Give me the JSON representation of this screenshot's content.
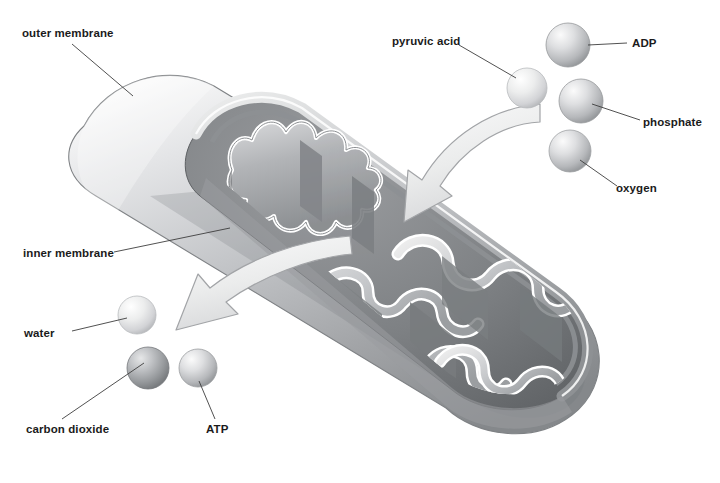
{
  "figure": {
    "background_color": "#ffffff",
    "label_color": "#1b1b1b",
    "leader_line_color": "#3d3d3d"
  },
  "labels": {
    "outer_membrane": "outer membrane",
    "inner_membrane": "inner membrane",
    "water": "water",
    "carbon_dioxide": "carbon dioxide",
    "atp": "ATP",
    "pyruvic_acid": "pyruvic acid",
    "adp": "ADP",
    "phosphate": "phosphate",
    "oxygen": "oxygen"
  },
  "molecules": [
    {
      "name": "pyruvic acid",
      "cx": 527,
      "cy": 88,
      "r": 20,
      "shade": "#e3e4e6",
      "side": "input"
    },
    {
      "name": "ADP",
      "cx": 568,
      "cy": 45,
      "r": 22,
      "shade": "#b9bbbd",
      "side": "input"
    },
    {
      "name": "phosphate",
      "cx": 581,
      "cy": 101,
      "r": 22,
      "shade": "#b9bbbd",
      "side": "input"
    },
    {
      "name": "oxygen",
      "cx": 570,
      "cy": 151,
      "r": 21,
      "shade": "#c8cacc",
      "side": "input"
    },
    {
      "name": "water",
      "cx": 137,
      "cy": 315,
      "r": 19,
      "shade": "#dcdde0",
      "side": "output"
    },
    {
      "name": "carbon dioxide",
      "cx": 148,
      "cy": 368,
      "r": 21,
      "shade": "#9b9ea1",
      "side": "output"
    },
    {
      "name": "ATP",
      "cx": 198,
      "cy": 368,
      "r": 19,
      "shade": "#c8cacc",
      "side": "output"
    }
  ],
  "arrows": [
    {
      "name": "inflow-arrow",
      "direction": "into-mitochondrion",
      "from": "upper-right",
      "to": "interior"
    },
    {
      "name": "outflow-arrow",
      "direction": "out-of-mitochondrion",
      "from": "interior",
      "to": "lower-left"
    }
  ],
  "colors": {
    "outer_membrane_light": "#f0f0f1",
    "outer_membrane_mid": "#c4c6c8",
    "outer_membrane_dark": "#8b8d90",
    "interior_dark": "#6f7174",
    "crista_fill": "#a7a9ac",
    "crista_outline": "#ffffff",
    "arrow_fill": "#ebebec",
    "arrow_stroke": "#9a9c9f"
  }
}
